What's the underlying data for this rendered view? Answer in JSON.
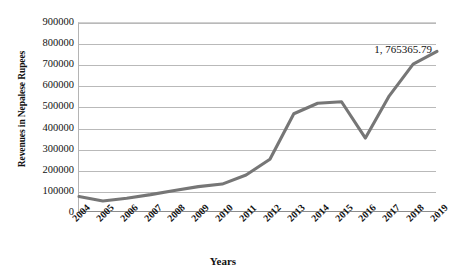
{
  "chart_data": {
    "type": "line",
    "title": "",
    "xlabel": "Years",
    "ylabel": "Revenues in Nepalese Rupees",
    "categories": [
      "2004",
      "2005",
      "2006",
      "2007",
      "2008",
      "2009",
      "2010",
      "2011",
      "2012",
      "2013",
      "2014",
      "2015",
      "2016",
      "2017",
      "2018",
      "2019"
    ],
    "values": [
      78000,
      57000,
      70000,
      87000,
      107000,
      125000,
      137000,
      180000,
      255000,
      470000,
      520000,
      527000,
      355000,
      555000,
      705000,
      765365.79
    ],
    "series": [
      {
        "name": "Revenues",
        "values": [
          78000,
          57000,
          70000,
          87000,
          107000,
          125000,
          137000,
          180000,
          255000,
          470000,
          520000,
          527000,
          355000,
          555000,
          705000,
          765365.79
        ]
      }
    ],
    "ylim": [
      0,
      900000
    ],
    "ytick_labels": [
      "900000",
      "800000",
      "700000",
      "600000",
      "500000",
      "400000",
      "300000",
      "200000",
      "100000",
      "0"
    ],
    "ytick_values": [
      900000,
      800000,
      700000,
      600000,
      500000,
      400000,
      300000,
      200000,
      100000,
      0
    ],
    "grid": true,
    "legend": "none",
    "annotations": [
      {
        "text": "1, 765365.79",
        "series": "Revenues",
        "category": "2019"
      }
    ],
    "series_color": "#767676",
    "gridline_color": "#b9b9b9"
  },
  "axes": {
    "y_title": "Revenues in Nepalese Rupees",
    "x_title": "Years"
  },
  "annotation": {
    "last_point_label": "1, 765365.79"
  }
}
